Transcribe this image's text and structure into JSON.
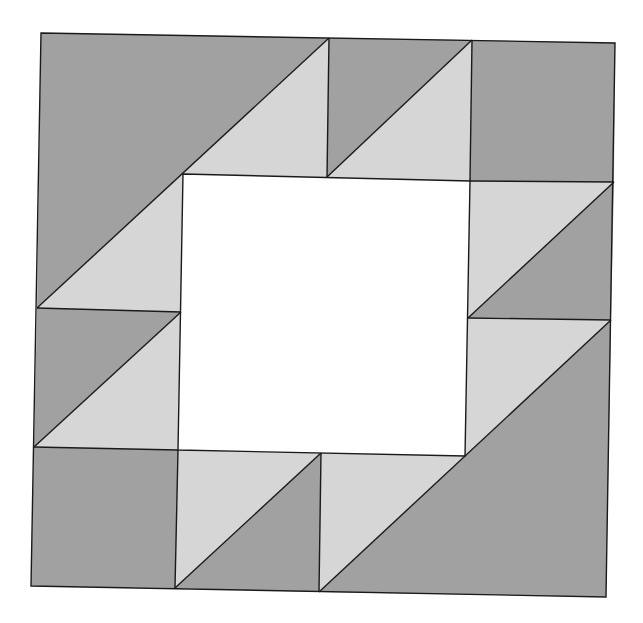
{
  "diagram": {
    "type": "quilt-block",
    "grid": "4x4 half-square-triangle block with open 2x2 center",
    "colors": {
      "dark": "#a1a1a1",
      "light": "#d6d6d6",
      "center": "#ffffff",
      "outline": "#1a1a1a"
    },
    "pieces": [
      {
        "name": "top-left-large-dark-triangle",
        "shade": "dark"
      },
      {
        "name": "top-left-large-light-region",
        "shade": "light"
      },
      {
        "name": "top-middle-hst-dark",
        "shade": "dark"
      },
      {
        "name": "top-middle-hst-light",
        "shade": "light"
      },
      {
        "name": "top-right-square",
        "shade": "dark"
      },
      {
        "name": "right-upper-hst-light",
        "shade": "light"
      },
      {
        "name": "right-upper-hst-dark",
        "shade": "dark"
      },
      {
        "name": "bottom-right-large-dark-triangle",
        "shade": "dark"
      },
      {
        "name": "bottom-right-large-light-region",
        "shade": "light"
      },
      {
        "name": "bottom-middle-hst-light",
        "shade": "light"
      },
      {
        "name": "bottom-middle-hst-dark",
        "shade": "dark"
      },
      {
        "name": "bottom-left-square",
        "shade": "dark"
      },
      {
        "name": "left-lower-hst-dark",
        "shade": "dark"
      },
      {
        "name": "left-lower-hst-light",
        "shade": "light"
      },
      {
        "name": "center-square",
        "shade": "center"
      }
    ]
  }
}
